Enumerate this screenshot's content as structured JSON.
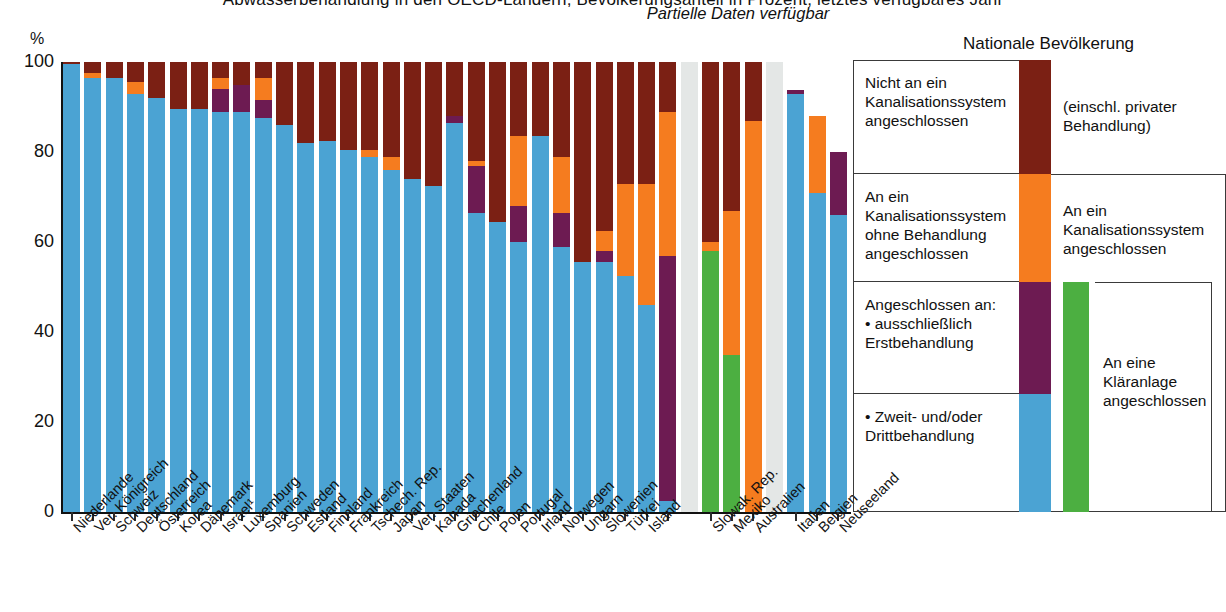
{
  "title_partial": "Abwasserbehandlung in den OECD-Ländern, Bevölkerungsanteil in Prozent, letztes verfügbares Jahr",
  "axis": {
    "unit_label": "%",
    "yticks": [
      "100",
      "80",
      "60",
      "40",
      "20",
      "0"
    ],
    "ylim": [
      0,
      100
    ]
  },
  "annotations": {
    "partial_data": "Partielle Daten\nverfügbar"
  },
  "legend": {
    "title": "Nationale Bevölkerung",
    "items": [
      {
        "label": "Nicht an ein\nKanalisationssystem\nangeschlossen",
        "color": "#7b2014",
        "name": "not-connected"
      },
      {
        "label": "An ein\nKanalisationssystem\nohne Behandlung\nangeschlossen",
        "color": "#f57c1f",
        "name": "sewerage-no-treatment"
      },
      {
        "label": "Angeschlossen an:\n• ausschließlich\n   Erstbehandlung",
        "color": "#6d1b52",
        "name": "primary-treatment-only"
      },
      {
        "label": "• Zweit- und/oder\n   Drittbehandlung",
        "color": "#4ba3d3",
        "name": "secondary-tertiary-treatment"
      }
    ],
    "groups": [
      {
        "label": "(einschl. privater\nBehandlung)",
        "name": "incl-private-treatment"
      },
      {
        "label": "An ein\nKanalisationssystem\nangeschlossen",
        "name": "connected-to-sewerage"
      },
      {
        "label": "An eine\nKläranlage\nangeschlossen",
        "name": "connected-to-treatment-plant"
      }
    ],
    "group_swatch_color": "#4caf41"
  },
  "colors": {
    "secondary_tertiary": "#4ba3d3",
    "primary_only": "#6d1b52",
    "no_treatment": "#f57c1f",
    "not_connected": "#7b2014",
    "treatment_plant_partial": "#4caf41",
    "missing": "#e4e7e6",
    "axis": "#111111"
  },
  "chart_data": {
    "type": "bar",
    "stacked": true,
    "title": "Abwasserbehandlung in den OECD-Ländern, Bevölkerungsanteil in Prozent, letztes verfügbares Jahr",
    "xlabel": "",
    "ylabel": "%",
    "ylim": [
      0,
      100
    ],
    "yticks": [
      0,
      20,
      40,
      60,
      80,
      100
    ],
    "grid": false,
    "legend_position": "right",
    "series": [
      {
        "name": "Zweit- und/oder Drittbehandlung",
        "color": "#4ba3d3"
      },
      {
        "name": "ausschließlich Erstbehandlung",
        "color": "#6d1b52"
      },
      {
        "name": "An ein Kanalisationssystem ohne Behandlung angeschlossen",
        "color": "#f57c1f"
      },
      {
        "name": "Nicht an ein Kanalisationssystem angeschlossen",
        "color": "#7b2014"
      },
      {
        "name": "An eine Kläranlage angeschlossen (partielle Daten)",
        "color": "#4caf41"
      },
      {
        "name": "Keine Daten",
        "color": "#e4e7e6"
      }
    ],
    "categories": [
      "Niederlande",
      "Ver. Königreich",
      "Schweiz",
      "Deutschland",
      "Österreich",
      "Korea",
      "Dänemark",
      "Israel",
      "Luxemburg",
      "Spanien",
      "Schweden",
      "Estland",
      "Finnland",
      "Frankreich",
      "Tschech. Rep.",
      "Japan",
      "Ver. Staaten",
      "Kanada",
      "Griechenland",
      "Chile",
      "Polen",
      "Portugal",
      "Irland",
      "Norwegen",
      "Ungarn",
      "Slowenien",
      "Türkei",
      "Island",
      "",
      "Slowak. Rep.",
      "Mexiko",
      "Australien",
      "",
      "Italien",
      "Belgien",
      "Neuseeland"
    ],
    "bars": [
      {
        "category": "Niederlande",
        "group": "main",
        "secondary_tertiary": 99.5,
        "primary_only": 0,
        "no_treatment": 0,
        "not_connected": 0.5,
        "green": 0,
        "missing": 0
      },
      {
        "category": "Ver. Königreich",
        "group": "main",
        "secondary_tertiary": 96.5,
        "primary_only": 0,
        "no_treatment": 1.0,
        "not_connected": 2.5,
        "green": 0,
        "missing": 0
      },
      {
        "category": "Schweiz",
        "group": "main",
        "secondary_tertiary": 96.5,
        "primary_only": 0,
        "no_treatment": 0,
        "not_connected": 3.5,
        "green": 0,
        "missing": 0
      },
      {
        "category": "Deutschland",
        "group": "main",
        "secondary_tertiary": 93.0,
        "primary_only": 0,
        "no_treatment": 2.5,
        "not_connected": 4.5,
        "green": 0,
        "missing": 0
      },
      {
        "category": "Österreich",
        "group": "main",
        "secondary_tertiary": 92.0,
        "primary_only": 0,
        "no_treatment": 0,
        "not_connected": 8.0,
        "green": 0,
        "missing": 0
      },
      {
        "category": "Korea",
        "group": "main",
        "secondary_tertiary": 89.5,
        "primary_only": 0,
        "no_treatment": 0,
        "not_connected": 10.5,
        "green": 0,
        "missing": 0
      },
      {
        "category": "Dänemark",
        "group": "main",
        "secondary_tertiary": 89.5,
        "primary_only": 0,
        "no_treatment": 0,
        "not_connected": 10.5,
        "green": 0,
        "missing": 0
      },
      {
        "category": "Israel",
        "group": "main",
        "secondary_tertiary": 89.0,
        "primary_only": 5.0,
        "no_treatment": 2.5,
        "not_connected": 3.5,
        "green": 0,
        "missing": 0
      },
      {
        "category": "Luxemburg",
        "group": "main",
        "secondary_tertiary": 89.0,
        "primary_only": 6.0,
        "no_treatment": 0,
        "not_connected": 5.0,
        "green": 0,
        "missing": 0
      },
      {
        "category": "Spanien",
        "group": "main",
        "secondary_tertiary": 87.5,
        "primary_only": 4.0,
        "no_treatment": 5.0,
        "not_connected": 3.5,
        "green": 0,
        "missing": 0
      },
      {
        "category": "Schweden",
        "group": "main",
        "secondary_tertiary": 86.0,
        "primary_only": 0,
        "no_treatment": 0,
        "not_connected": 14.0,
        "green": 0,
        "missing": 0
      },
      {
        "category": "Estland",
        "group": "main",
        "secondary_tertiary": 82.0,
        "primary_only": 0,
        "no_treatment": 0,
        "not_connected": 18.0,
        "green": 0,
        "missing": 0
      },
      {
        "category": "Finnland",
        "group": "main",
        "secondary_tertiary": 82.5,
        "primary_only": 0,
        "no_treatment": 0,
        "not_connected": 17.5,
        "green": 0,
        "missing": 0
      },
      {
        "category": "Frankreich",
        "group": "main",
        "secondary_tertiary": 80.5,
        "primary_only": 0,
        "no_treatment": 0,
        "not_connected": 19.5,
        "green": 0,
        "missing": 0
      },
      {
        "category": "Tschech. Rep.",
        "group": "main",
        "secondary_tertiary": 79.0,
        "primary_only": 0,
        "no_treatment": 1.5,
        "not_connected": 19.5,
        "green": 0,
        "missing": 0
      },
      {
        "category": "Japan",
        "group": "main",
        "secondary_tertiary": 76.0,
        "primary_only": 0,
        "no_treatment": 3.0,
        "not_connected": 21.0,
        "green": 0,
        "missing": 0
      },
      {
        "category": "Ver. Staaten",
        "group": "main",
        "secondary_tertiary": 74.0,
        "primary_only": 0,
        "no_treatment": 0,
        "not_connected": 26.0,
        "green": 0,
        "missing": 0
      },
      {
        "category": "Kanada",
        "group": "main",
        "secondary_tertiary": 72.5,
        "primary_only": 0,
        "no_treatment": 0,
        "not_connected": 27.5,
        "green": 0,
        "missing": 0
      },
      {
        "category": "Griechenland",
        "group": "main",
        "secondary_tertiary": 86.5,
        "primary_only": 1.5,
        "no_treatment": 0,
        "not_connected": 12.0,
        "green": 0,
        "missing": 0
      },
      {
        "category": "Chile",
        "group": "main",
        "secondary_tertiary": 66.5,
        "primary_only": 10.5,
        "no_treatment": 1.0,
        "not_connected": 22.0,
        "green": 0,
        "missing": 0
      },
      {
        "category": "Polen",
        "group": "main",
        "secondary_tertiary": 64.5,
        "primary_only": 0,
        "no_treatment": 0,
        "not_connected": 35.5,
        "green": 0,
        "missing": 0
      },
      {
        "category": "Portugal",
        "group": "main",
        "secondary_tertiary": 60.0,
        "primary_only": 8.0,
        "no_treatment": 15.5,
        "not_connected": 16.5,
        "green": 0,
        "missing": 0
      },
      {
        "category": "Irland",
        "group": "main",
        "secondary_tertiary": 83.5,
        "primary_only": 0,
        "no_treatment": 0,
        "not_connected": 16.5,
        "green": 0,
        "missing": 0
      },
      {
        "category": "Norwegen",
        "group": "main",
        "secondary_tertiary": 59.0,
        "primary_only": 7.5,
        "no_treatment": 12.5,
        "not_connected": 21.0,
        "green": 0,
        "missing": 0
      },
      {
        "category": "Ungarn",
        "group": "main",
        "secondary_tertiary": 55.5,
        "primary_only": 0,
        "no_treatment": 0,
        "not_connected": 44.5,
        "green": 0,
        "missing": 0
      },
      {
        "category": "Slowenien",
        "group": "main",
        "secondary_tertiary": 55.5,
        "primary_only": 2.5,
        "no_treatment": 4.5,
        "not_connected": 37.5,
        "green": 0,
        "missing": 0
      },
      {
        "category": "Türkei",
        "group": "main",
        "secondary_tertiary": 52.5,
        "primary_only": 0,
        "no_treatment": 20.5,
        "not_connected": 27.0,
        "green": 0,
        "missing": 0
      },
      {
        "category": "Island",
        "group": "main",
        "secondary_tertiary": 46.0,
        "primary_only": 0,
        "no_treatment": 27.0,
        "not_connected": 27.0,
        "green": 0,
        "missing": 0
      },
      {
        "category": "Island2",
        "group": "main",
        "secondary_tertiary": 2.5,
        "primary_only": 54.5,
        "no_treatment": 32.0,
        "not_connected": 11.0,
        "green": 0,
        "missing": 0
      },
      {
        "category": "gap1",
        "group": "gap",
        "secondary_tertiary": 0,
        "primary_only": 0,
        "no_treatment": 0,
        "not_connected": 0,
        "green": 0,
        "missing": 100
      },
      {
        "category": "Slowak. Rep.",
        "group": "partial",
        "secondary_tertiary": 0,
        "primary_only": 0,
        "no_treatment": 2.0,
        "not_connected": 40.0,
        "green": 58.0,
        "missing": 0
      },
      {
        "category": "Mexiko",
        "group": "partial",
        "secondary_tertiary": 0,
        "primary_only": 0,
        "no_treatment": 32.0,
        "not_connected": 33.0,
        "green": 35.0,
        "missing": 0
      },
      {
        "category": "Australien",
        "group": "partial",
        "secondary_tertiary": 0,
        "primary_only": 0,
        "no_treatment": 87.0,
        "not_connected": 13.0,
        "green": 0,
        "missing": 0
      },
      {
        "category": "gap2",
        "group": "gap",
        "secondary_tertiary": 0,
        "primary_only": 0,
        "no_treatment": 0,
        "not_connected": 0,
        "green": 0,
        "missing": 100
      },
      {
        "category": "Italien",
        "group": "right",
        "secondary_tertiary": 93.0,
        "primary_only": 0.8,
        "no_treatment": 0,
        "not_connected": 0,
        "green": 0,
        "missing": 0
      },
      {
        "category": "Belgien",
        "group": "right",
        "secondary_tertiary": 71.0,
        "primary_only": 0,
        "no_treatment": 17.0,
        "not_connected": 0,
        "green": 0,
        "missing": 0
      },
      {
        "category": "Neuseeland",
        "group": "right",
        "secondary_tertiary": 66.0,
        "primary_only": 14.0,
        "no_treatment": 0,
        "not_connected": 0,
        "green": 0,
        "missing": 0
      }
    ],
    "xlabels": [
      {
        "text": "Niederlande",
        "bar": 0
      },
      {
        "text": "Ver. Königreich",
        "bar": 1
      },
      {
        "text": "Schweiz",
        "bar": 2
      },
      {
        "text": "Deutschland",
        "bar": 3
      },
      {
        "text": "Österreich",
        "bar": 4
      },
      {
        "text": "Korea",
        "bar": 5
      },
      {
        "text": "Dänemark",
        "bar": 6
      },
      {
        "text": "Israel¹",
        "bar": 7
      },
      {
        "text": "Luxemburg",
        "bar": 8
      },
      {
        "text": "Spanien",
        "bar": 9
      },
      {
        "text": "Schweden",
        "bar": 10
      },
      {
        "text": "Estland",
        "bar": 11
      },
      {
        "text": "Finnland",
        "bar": 12
      },
      {
        "text": "Frankreich",
        "bar": 13
      },
      {
        "text": "Tschech. Rep.",
        "bar": 14
      },
      {
        "text": "Japan",
        "bar": 15
      },
      {
        "text": "Ver. Staaten",
        "bar": 16
      },
      {
        "text": "Kanada",
        "bar": 17
      },
      {
        "text": "Griechenland",
        "bar": 18
      },
      {
        "text": "Chile",
        "bar": 19
      },
      {
        "text": "Polen",
        "bar": 20
      },
      {
        "text": "Portugal",
        "bar": 21
      },
      {
        "text": "Irland",
        "bar": 22
      },
      {
        "text": "Norwegen",
        "bar": 23
      },
      {
        "text": "Ungarn",
        "bar": 24
      },
      {
        "text": "Slowenien",
        "bar": 25
      },
      {
        "text": "Türkei",
        "bar": 26
      },
      {
        "text": "Island",
        "bar": 27
      },
      {
        "text": "Slowak. Rep.",
        "bar": 30
      },
      {
        "text": "Mexiko",
        "bar": 31
      },
      {
        "text": "Australien",
        "bar": 32
      },
      {
        "text": "Italien",
        "bar": 34
      },
      {
        "text": "Belgien",
        "bar": 35
      },
      {
        "text": "Neuseeland",
        "bar": 36
      }
    ]
  }
}
